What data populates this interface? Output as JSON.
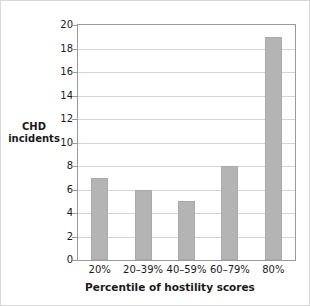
{
  "chart_data": {
    "type": "bar",
    "title": "",
    "xlabel": "Percentile of hostility scores",
    "ylabel": "CHD incidents",
    "ylabel_lines": [
      "CHD",
      "incidents"
    ],
    "categories": [
      "20%",
      "20–39%",
      "40–59%",
      "60–79%",
      "80%"
    ],
    "values": [
      7,
      6,
      5,
      8,
      19
    ],
    "ylim": [
      0,
      20
    ],
    "yticks": [
      0,
      2,
      4,
      6,
      8,
      10,
      12,
      14,
      16,
      18,
      20
    ],
    "ytick_labels": [
      "0",
      "2",
      "4",
      "6",
      "8",
      "10",
      "12",
      "14",
      "16",
      "18",
      "20"
    ],
    "grid": true,
    "legend": "none",
    "bar_color": "#b4b4b4",
    "gridline_color": "#d5d5d5",
    "axis_color": "#9a9a9a",
    "text_color": "#1a1a1a",
    "background_color": "#ffffff"
  }
}
